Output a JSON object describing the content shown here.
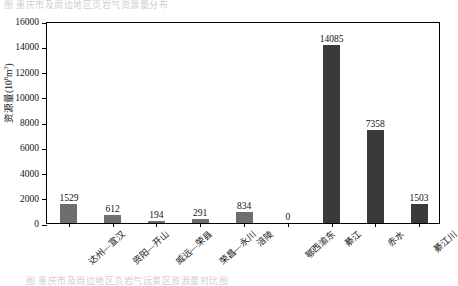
{
  "figure": {
    "top_cut_text": "图 重庆市及周边地区页岩气资源量分布",
    "bottom_cut_text": "图        重庆市及周边地区页岩气远景区资源量对比图"
  },
  "axes": {
    "y_title": "资源量",
    "y_unit_prefix": "(10",
    "y_unit_exp": "8",
    "y_unit_suffix": "m",
    "y_unit_exp2": "3",
    "y_unit_close": ")",
    "y_ticks": [
      "0",
      "2000",
      "4000",
      "6000",
      "8000",
      "10000",
      "12000",
      "14000",
      "16000"
    ],
    "y_min": 0,
    "y_max": 16000
  },
  "chart_data": {
    "type": "bar",
    "title": "",
    "xlabel": "",
    "ylabel": "资源量 (10⁸m³)",
    "ylim": [
      0,
      16000
    ],
    "ytick_step": 2000,
    "grid": false,
    "legend": false,
    "categories": [
      "达州—宣汉",
      "资阳—开山",
      "威远—荣县",
      "荣昌—永川",
      "涪陵",
      "鄂西渝东",
      "綦江",
      "赤水",
      "綦江川"
    ],
    "values": [
      1529,
      612,
      194,
      291,
      834,
      0,
      14085,
      7358,
      1503
    ],
    "value_labels": [
      "1529",
      "612",
      "194",
      "291",
      "834",
      "0",
      "14085",
      "7358",
      "1503"
    ],
    "bar_colors": [
      "#6e6e6e",
      "#6e6e6e",
      "#6e6e6e",
      "#6e6e6e",
      "#6e6e6e",
      "#6e6e6e",
      "#3a3a3a",
      "#3a3a3a",
      "#3a3a3a"
    ]
  },
  "colors": {
    "bar_light": "#6e6e6e",
    "bar_dark": "#3a3a3a",
    "axis": "#000000",
    "text": "#111111",
    "background": "#ffffff"
  }
}
